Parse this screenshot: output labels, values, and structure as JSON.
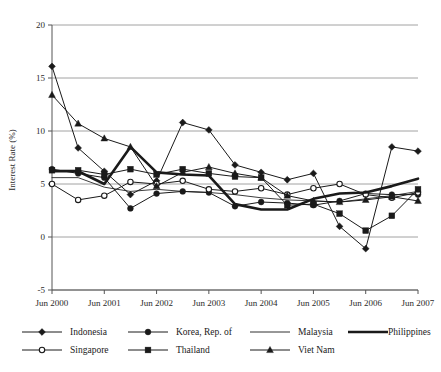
{
  "chart_data": {
    "type": "line",
    "title": "",
    "xlabel": "",
    "ylabel": "Interest Rate (%)",
    "ylim": [
      -5,
      20
    ],
    "yticks": [
      -5,
      0,
      5,
      10,
      15,
      20
    ],
    "ytick_labels": [
      "-5",
      "0",
      "5",
      "10",
      "15",
      "20"
    ],
    "grid": true,
    "legend_position": "bottom",
    "xtick_labels": [
      "Jun 2000",
      "Jun 2001",
      "Jun 2002",
      "Jun 2003",
      "Jun 2004",
      "Jun 2005",
      "Jun 2006",
      "Jun 2007"
    ],
    "x": [
      "Jun 2000",
      "Dec 2000",
      "Jun 2001",
      "Dec 2001",
      "Jun 2002",
      "Dec 2002",
      "Jun 2003",
      "Dec 2003",
      "Jun 2004",
      "Dec 2004",
      "Jun 2005",
      "Dec 2005",
      "Jun 2006",
      "Dec 2006",
      "Jun 2007"
    ],
    "series": [
      {
        "name": "Indonesia",
        "marker": "diamond",
        "values": [
          16.1,
          8.4,
          6.2,
          4.0,
          5.3,
          10.8,
          10.1,
          6.8,
          6.1,
          5.4,
          6.0,
          1.0,
          -1.1,
          8.5,
          8.1
        ]
      },
      {
        "name": "Korea, Rep. of",
        "marker": "circle-filled",
        "values": [
          6.4,
          6.0,
          5.6,
          2.7,
          4.1,
          4.3,
          4.2,
          2.9,
          3.3,
          3.2,
          3.0,
          3.4,
          4.1,
          4.0,
          4.0
        ]
      },
      {
        "name": "Malaysia",
        "marker": "none",
        "values": [
          5.6,
          5.6,
          4.7,
          4.3,
          4.5,
          4.3,
          4.2,
          4.0,
          3.7,
          3.5,
          3.4,
          3.3,
          3.6,
          3.9,
          4.3
        ]
      },
      {
        "name": "Philippines",
        "marker": "none-thick",
        "values": [
          6.2,
          6.2,
          5.0,
          8.5,
          6.1,
          5.9,
          5.8,
          3.1,
          2.6,
          2.6,
          3.6,
          4.1,
          4.2,
          4.8,
          5.5
        ]
      },
      {
        "name": "Singapore",
        "marker": "circle-open",
        "values": [
          5.0,
          3.5,
          3.9,
          5.2,
          5.0,
          5.3,
          4.5,
          4.3,
          4.6,
          4.0,
          4.6,
          5.0,
          4.0,
          3.7,
          4.2
        ]
      },
      {
        "name": "Thailand",
        "marker": "square-filled",
        "values": [
          6.3,
          6.3,
          5.9,
          6.4,
          5.9,
          6.4,
          6.0,
          5.7,
          5.6,
          3.0,
          3.1,
          2.2,
          0.6,
          2.0,
          4.5
        ]
      },
      {
        "name": "Viet Nam",
        "marker": "triangle-filled",
        "values": [
          13.4,
          10.7,
          9.3,
          8.5,
          4.8,
          6.1,
          6.6,
          6.0,
          5.6,
          3.9,
          3.4,
          3.3,
          3.5,
          3.8,
          3.4
        ]
      }
    ]
  },
  "legend": {
    "items": [
      {
        "label": "Indonesia"
      },
      {
        "label": "Korea, Rep. of"
      },
      {
        "label": "Malaysia"
      },
      {
        "label": "Philippines"
      },
      {
        "label": "Singapore"
      },
      {
        "label": "Thailand"
      },
      {
        "label": "Viet Nam"
      }
    ]
  },
  "colors": {
    "line": "#1a1a1a",
    "grid": "#8c8c8c",
    "axis": "#555555",
    "text": "#1a1a1a",
    "background": "#ffffff"
  }
}
